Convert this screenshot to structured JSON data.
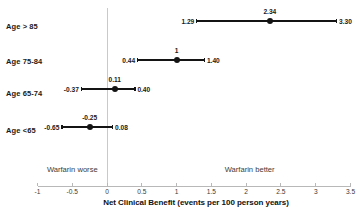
{
  "chart_data": {
    "type": "scatter",
    "subtype": "forest-plot",
    "title": "",
    "xlabel": "Net Clinical Benefit (events per 100 person years)",
    "ylabel": "",
    "xlim": [
      -1,
      3.5
    ],
    "xticks": [
      -1,
      -0.5,
      0,
      0.5,
      1,
      1.5,
      2,
      2.5,
      3,
      3.5
    ],
    "xticklabels": [
      "-1",
      "-0.5",
      "0",
      "0.5",
      "1",
      "1.5",
      "2",
      "2.5",
      "3",
      "3.5"
    ],
    "grid": false,
    "legend": null,
    "reference_line": 0,
    "categories": [
      "Age > 85",
      "Age 75-84",
      "Age 65-74",
      "Age <65"
    ],
    "points": [
      {
        "category": "Age > 85",
        "estimate": 2.34,
        "ci_low": 1.29,
        "ci_high": 3.3,
        "estimate_label": "2.34",
        "ci_low_label": "1.29",
        "ci_high_label": "3.30"
      },
      {
        "category": "Age 75-84",
        "estimate": 1.0,
        "ci_low": 0.44,
        "ci_high": 1.4,
        "estimate_label": "1",
        "ci_low_label": "0.44",
        "ci_high_label": "1.40"
      },
      {
        "category": "Age 65-74",
        "estimate": 0.11,
        "ci_low": -0.37,
        "ci_high": 0.4,
        "estimate_label": "0.11",
        "ci_low_label": "-0.37",
        "ci_high_label": "0.40"
      },
      {
        "category": "Age <65",
        "estimate": -0.25,
        "ci_low": -0.65,
        "ci_high": 0.08,
        "estimate_label": "-0.25",
        "ci_low_label": "-0.65",
        "ci_high_label": "0.08"
      }
    ],
    "annotations": [
      {
        "text": "Warfarin worse",
        "x": -0.5
      },
      {
        "text": "Warfarin better",
        "x": 2.05
      }
    ],
    "colors": {
      "marker": "#141414",
      "ci_line": "#141414",
      "axis": "#b8b8b8",
      "reference_line": "#c9c9c9",
      "text": "#1a1a1a"
    }
  }
}
